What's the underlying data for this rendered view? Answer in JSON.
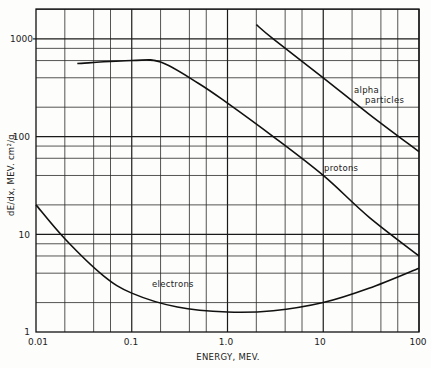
{
  "chart_data": {
    "type": "line",
    "title": "",
    "xlabel": "ENERGY, MEV.",
    "ylabel": "dE/dx, MEV. cm²/g",
    "xscale": "log",
    "yscale": "log",
    "xlim": [
      0.01,
      100
    ],
    "ylim": [
      1,
      2000
    ],
    "grid": true,
    "x_tick_labels": [
      "0.01",
      "0.1",
      "1.0",
      "10",
      "100"
    ],
    "y_tick_labels": [
      "1",
      "10",
      "100",
      "1000"
    ],
    "series": [
      {
        "name": "electrons",
        "x": [
          0.01,
          0.02,
          0.05,
          0.1,
          0.3,
          1.0,
          3.0,
          10,
          30,
          100
        ],
        "y": [
          20,
          9,
          3.8,
          2.5,
          1.8,
          1.6,
          1.65,
          2.0,
          2.8,
          4.5
        ]
      },
      {
        "name": "protons",
        "x": [
          0.027,
          0.1,
          0.2,
          0.5,
          1.0,
          3.0,
          10,
          30,
          100
        ],
        "y": [
          560,
          600,
          580,
          350,
          220,
          100,
          40,
          15,
          6
        ]
      },
      {
        "name": "alpha particles",
        "x": [
          2,
          3,
          10,
          30,
          100
        ],
        "y": [
          1400,
          1000,
          400,
          170,
          70
        ]
      }
    ],
    "annotations": [
      {
        "text": "electrons",
        "near": "electrons curve"
      },
      {
        "text": "protons",
        "near": "protons curve"
      },
      {
        "text": "alpha particles",
        "near": "alpha particles curve"
      }
    ]
  },
  "labels": {
    "xlabel": "ENERGY, MEV.",
    "ylabel": "dE/dx, MEV. cm²/g",
    "electrons": "electrons",
    "protons": "protons",
    "alpha_line1": "alpha",
    "alpha_line2": "particles",
    "xt0": "0.01",
    "xt1": "0.1",
    "xt2": "1.0",
    "xt3": "10",
    "xt4": "100",
    "yt0": "1",
    "yt1": "10",
    "yt2": "100",
    "yt3": "1000"
  }
}
